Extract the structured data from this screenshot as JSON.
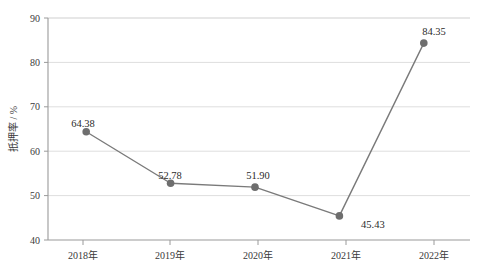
{
  "chart_data": {
    "type": "line",
    "title": "",
    "subtitle": "",
    "xlabel": "",
    "ylabel": "抵押率 / %",
    "categories": [
      "2018年",
      "2019年",
      "2020年",
      "2021年",
      "2022年"
    ],
    "values": [
      64.38,
      52.78,
      51.9,
      45.43,
      84.35
    ],
    "point_labels": [
      "64.38",
      "52.78",
      "51.90",
      "45.43",
      "84.35"
    ],
    "series": [
      {
        "name": "抵押率",
        "values": [
          64.38,
          52.78,
          51.9,
          45.43,
          84.35
        ]
      }
    ],
    "ylim": [
      40,
      90
    ],
    "yticks": [
      40,
      50,
      60,
      70,
      80,
      90
    ],
    "ytick_labels": [
      "40",
      "50",
      "60",
      "70",
      "80",
      "90"
    ],
    "grid": true,
    "grid_axis": "y",
    "legend": false,
    "legend_position": "none",
    "marker": "circle",
    "line_color": "#7a7a7a",
    "marker_color": "#6e6e6e",
    "grid_color": "#d9d9d9",
    "axis_color": "#9a9a9a",
    "background_color": "#ffffff",
    "text_color": "#3a3a3a"
  },
  "axis": {
    "y_title": "抵押率 / %",
    "y_ticks": [
      "90",
      "80",
      "70",
      "60",
      "50",
      "40"
    ],
    "x_ticks": [
      "2018年",
      "2019年",
      "2020年",
      "2021年",
      "2022年"
    ]
  },
  "labels": {
    "p0": "64.38",
    "p1": "52.78",
    "p2": "51.90",
    "p3": "45.43",
    "p4": "84.35"
  }
}
